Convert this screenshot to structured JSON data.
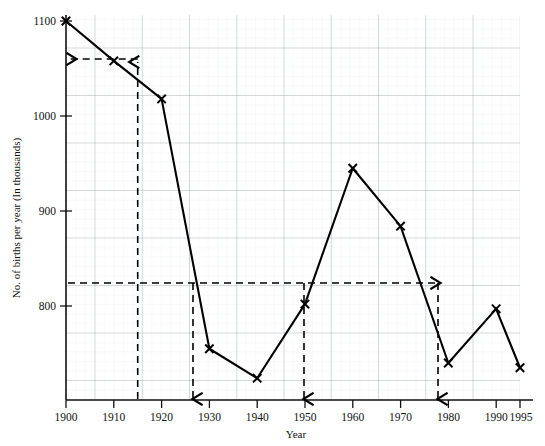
{
  "chart_data": {
    "type": "line",
    "title": "",
    "xlabel": "Year",
    "ylabel": "No. of births per year (In thousands)",
    "x": [
      1900,
      1910,
      1920,
      1930,
      1940,
      1950,
      1960,
      1970,
      1980,
      1990,
      1995
    ],
    "values": [
      1100,
      1058,
      1018,
      755,
      724,
      802,
      945,
      884,
      740,
      797,
      735
    ],
    "xlim": [
      1900,
      1995
    ],
    "ylim": [
      715,
      1105
    ],
    "xticks": [
      1900,
      1910,
      1920,
      1930,
      1940,
      1950,
      1960,
      1970,
      1980,
      1990,
      1995
    ],
    "xtick_labels": [
      "1900",
      "1910",
      "1920",
      "1930",
      "1940",
      "1950",
      "1960",
      "1970",
      "1980",
      "1990",
      "1995"
    ],
    "yticks": [
      800,
      900,
      1000,
      1100
    ],
    "ytick_labels": [
      "800",
      "900",
      "1000",
      "1100"
    ],
    "grid": "graph-paper minor and major gridlines",
    "marker": "x",
    "legend": "none",
    "annotations": [
      {
        "name": "read-off-1915",
        "type": "construction-line",
        "from_axis": "x",
        "x": 1915,
        "y": 1040,
        "description": "Vertical dashed line up from x=1915 to curve, then horizontal dashed line left to y-axis at ~1040"
      },
      {
        "name": "read-off-825",
        "type": "construction-line",
        "from_axis": "y",
        "y": 825,
        "x_intersections": [
          1927,
          1951,
          1974
        ],
        "description": "Horizontal dashed line from y-axis at ~825 crossing the curve at ~1927, ~1951 and ~1974, with vertical dashed drops to the x-axis"
      }
    ]
  },
  "caption": {
    "text": ""
  }
}
